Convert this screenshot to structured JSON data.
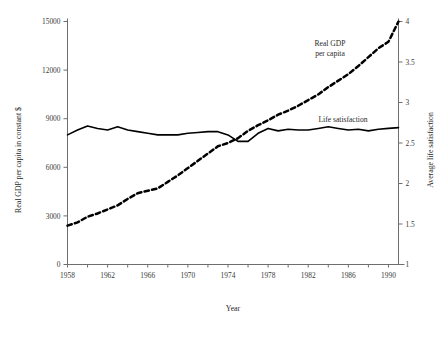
{
  "chart_data": {
    "type": "line",
    "title": "",
    "xlabel": "Year",
    "ylabel": "Real GDP per capita in constant $",
    "y2label": "Average life satisfaction",
    "xlim": [
      1958,
      1991
    ],
    "ylim": [
      0,
      15000
    ],
    "y2lim": [
      1,
      4
    ],
    "grid": false,
    "legend_position": "inline-annotations",
    "x_tick_labels": [
      "1958",
      "1962",
      "1966",
      "1970",
      "1974",
      "1978",
      "1982",
      "1986",
      "1990"
    ],
    "x_tick_values": [
      1958,
      1962,
      1966,
      1970,
      1974,
      1978,
      1982,
      1986,
      1990
    ],
    "x_minor_tick_values": [
      1960,
      1964,
      1968,
      1972,
      1976,
      1980,
      1984,
      1988
    ],
    "y_tick_labels": [
      "0",
      "3000",
      "6000",
      "9000",
      "12000",
      "15000"
    ],
    "y_tick_values": [
      0,
      3000,
      6000,
      9000,
      12000,
      15000
    ],
    "y2_tick_labels": [
      "1",
      "1.5",
      "2",
      "2.5",
      "3",
      "3.5",
      "4"
    ],
    "y2_tick_values": [
      1,
      1.5,
      2,
      2.5,
      3,
      3.5,
      4
    ],
    "annotations": [
      {
        "text_line1": "Real GDP",
        "text_line2": "per capita",
        "x": 1984,
        "y": 13200
      },
      {
        "text_line1": "Life satisfaction",
        "text_line2": "",
        "x": 1985,
        "y": 8150
      }
    ],
    "x": [
      1958,
      1959,
      1960,
      1961,
      1962,
      1963,
      1964,
      1965,
      1966,
      1967,
      1968,
      1969,
      1970,
      1971,
      1972,
      1973,
      1974,
      1975,
      1976,
      1977,
      1978,
      1979,
      1980,
      1981,
      1982,
      1983,
      1984,
      1985,
      1986,
      1987,
      1988,
      1989,
      1990,
      1991
    ],
    "series": [
      {
        "name": "Real GDP per capita",
        "style": "dashed",
        "axis": "left",
        "values": [
          2400,
          2600,
          2950,
          3150,
          3400,
          3650,
          4050,
          4400,
          4550,
          4700,
          5100,
          5500,
          5950,
          6400,
          6850,
          7300,
          7500,
          7800,
          8250,
          8600,
          8900,
          9250,
          9500,
          9800,
          10150,
          10500,
          10950,
          11350,
          11750,
          12250,
          12800,
          13350,
          13750,
          15000
        ]
      },
      {
        "name": "Life satisfaction",
        "style": "solid",
        "axis": "right",
        "values": [
          2.6,
          2.66,
          2.71,
          2.68,
          2.66,
          2.7,
          2.66,
          2.64,
          2.62,
          2.6,
          2.6,
          2.6,
          2.62,
          2.63,
          2.64,
          2.64,
          2.6,
          2.52,
          2.52,
          2.62,
          2.68,
          2.65,
          2.67,
          2.66,
          2.66,
          2.68,
          2.7,
          2.68,
          2.66,
          2.67,
          2.65,
          2.67,
          2.68,
          2.69
        ]
      }
    ]
  }
}
